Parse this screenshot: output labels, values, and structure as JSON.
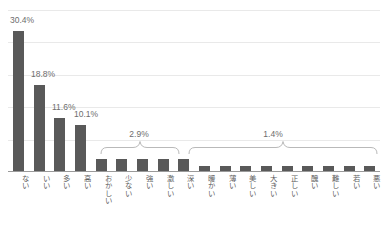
{
  "chart_data": {
    "type": "bar",
    "title": "",
    "subtitle": "",
    "xlabel": "",
    "ylabel": "",
    "ylim": [
      0,
      35
    ],
    "grid": true,
    "gridlines": [
      0,
      7,
      14,
      21,
      28,
      35
    ],
    "legend_position": "none",
    "units": "%",
    "bar_color": "#595959",
    "categories": [
      "ない",
      "いい",
      "多い",
      "高い",
      "おかしい",
      "少ない",
      "強い",
      "激しい",
      "深い",
      "暖かい",
      "薄い",
      "美しい",
      "大きい",
      "正しい",
      "醜い",
      "難しい",
      "若い",
      "悪い"
    ],
    "values": [
      30.4,
      18.8,
      11.6,
      10.1,
      2.9,
      2.9,
      2.9,
      2.9,
      2.9,
      1.4,
      1.4,
      1.4,
      1.4,
      1.4,
      1.4,
      1.4,
      1.4,
      1.4
    ],
    "point_labels": [
      "30.4%",
      "18.8%",
      "11.6%",
      "10.1%"
    ],
    "annotations": [
      {
        "text": "2.9%",
        "covers": [
          "おかしい",
          "少ない",
          "強い",
          "激しい",
          "深い"
        ],
        "style": "brace"
      },
      {
        "text": "1.4%",
        "covers": [
          "暖かい",
          "薄い",
          "美しい",
          "大きい",
          "正しい",
          "醜い",
          "難しい",
          "若い",
          "悪い"
        ],
        "style": "brace"
      }
    ]
  },
  "labels": {
    "v0": "30.4%",
    "v1": "18.8%",
    "v2": "11.6%",
    "v3": "10.1%",
    "group_a": "2.9%",
    "group_b": "1.4%"
  },
  "cats": {
    "c0": "ない",
    "c1": "いい",
    "c2": "多い",
    "c3": "高い",
    "c4": "おかしい",
    "c5": "少ない",
    "c6": "強い",
    "c7": "激しい",
    "c8": "深い",
    "c9": "暖かい",
    "c10": "薄い",
    "c11": "美しい",
    "c12": "大きい",
    "c13": "正しい",
    "c14": "醜い",
    "c15": "難しい",
    "c16": "若い",
    "c17": "悪い"
  },
  "caption": {
    "text": ""
  }
}
